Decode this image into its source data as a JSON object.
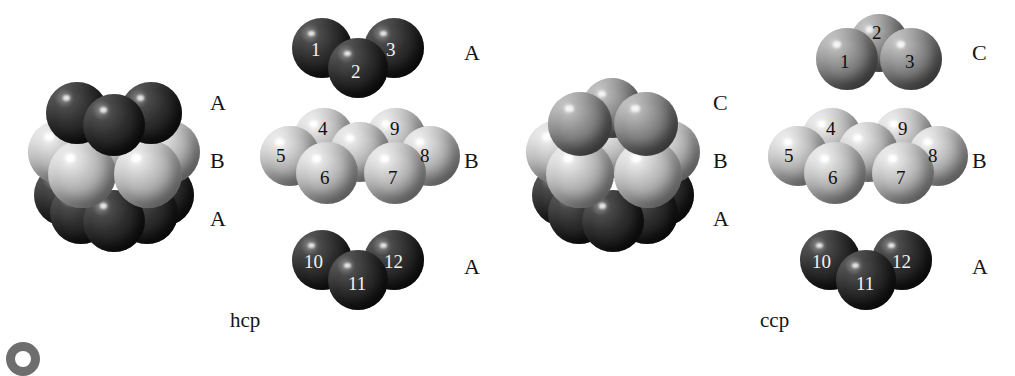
{
  "figure": {
    "background_color": "#ffffff",
    "colors": {
      "layer_a_dark": "#2b2b2b",
      "layer_b_light": "#b8b8b8",
      "layer_c_medium": "#7d7d7d",
      "text": "#151515"
    }
  },
  "panels": [
    {
      "id": "hcp",
      "caption": "hcp",
      "cluster": {
        "layer_labels": [
          "A",
          "B",
          "A"
        ],
        "top_layer_type": "dark",
        "middle_layer_type": "light",
        "bottom_layer_type": "dark"
      },
      "exploded": {
        "layers": [
          {
            "label": "A",
            "type": "dark",
            "orientation": "two-up-one-down",
            "spheres": [
              "1",
              "2",
              "3"
            ]
          },
          {
            "label": "B",
            "type": "light",
            "orientation": "seven-sphere-hexagonal",
            "spheres": [
              "4",
              "9",
              "5",
              "8",
              "6",
              "7"
            ],
            "unlabeled_center_count": 1
          },
          {
            "label": "A",
            "type": "dark",
            "orientation": "two-up-one-down",
            "spheres": [
              "10",
              "11",
              "12"
            ]
          }
        ]
      }
    },
    {
      "id": "ccp",
      "caption": "ccp",
      "cluster": {
        "layer_labels": [
          "C",
          "B",
          "A"
        ],
        "top_layer_type": "medium",
        "middle_layer_type": "light",
        "bottom_layer_type": "dark"
      },
      "exploded": {
        "layers": [
          {
            "label": "C",
            "type": "medium",
            "orientation": "one-up-two-down",
            "spheres": [
              "2",
              "1",
              "3"
            ]
          },
          {
            "label": "B",
            "type": "light",
            "orientation": "seven-sphere-hexagonal",
            "spheres": [
              "4",
              "9",
              "5",
              "8",
              "6",
              "7"
            ],
            "unlabeled_center_count": 1
          },
          {
            "label": "A",
            "type": "dark",
            "orientation": "two-up-one-down",
            "spheres": [
              "10",
              "11",
              "12"
            ]
          }
        ]
      }
    }
  ]
}
